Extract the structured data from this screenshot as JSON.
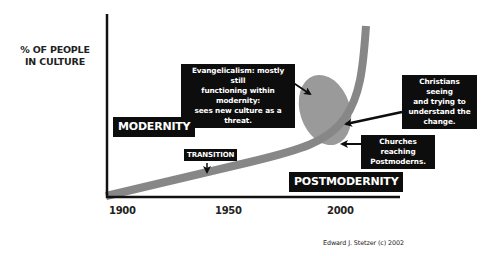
{
  "diagram": {
    "y_axis_label_line1": "% OF PEOPLE",
    "y_axis_label_line2": "IN CULTURE",
    "x_ticks": [
      "1900",
      "1950",
      "2000"
    ],
    "eras": {
      "modernity": "MODERNITY",
      "postmodernity": "POSTMODERNITY"
    },
    "transition_label": "TRANSITION",
    "callouts": {
      "evangelicalism": {
        "line1": "Evangelicalism: mostly still",
        "line2": "functioning within modernity:",
        "line3": "sees new culture as a threat."
      },
      "christians_seeing": {
        "line1": "Christians seeing",
        "line2": "and trying to",
        "line3": "understand the",
        "line4": "change."
      },
      "churches_reaching": {
        "line1": "Churches reaching",
        "line2": "Postmoderns."
      }
    },
    "credit": "Edward J. Stetzer (c) 2002",
    "colors": {
      "curve": "#8a8a8a",
      "ellipse": "#9a9a9a",
      "label_bg": "#0d0d0d",
      "label_text": "#ffffff",
      "axis": "#111111"
    }
  }
}
